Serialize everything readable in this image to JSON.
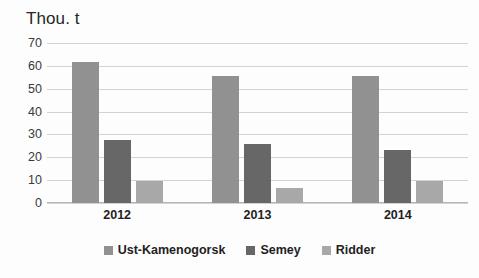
{
  "chart_data": {
    "type": "bar",
    "title": "Thou. t",
    "xlabel": "",
    "ylabel": "",
    "ylim": [
      0,
      70
    ],
    "ytick_step": 10,
    "yticks": [
      70,
      60,
      50,
      40,
      30,
      20,
      10,
      0
    ],
    "grid": true,
    "legend_position": "bottom",
    "categories": [
      "2012",
      "2013",
      "2014"
    ],
    "series": [
      {
        "name": "Ust-Kamenogorsk",
        "color": "#919191",
        "values": [
          61.7,
          55.5,
          55.5
        ]
      },
      {
        "name": "Semey",
        "color": "#676767",
        "values": [
          27.5,
          25.8,
          23.0
        ]
      },
      {
        "name": "Ridder",
        "color": "#a8a8a8",
        "values": [
          9.6,
          6.5,
          9.5
        ]
      }
    ]
  }
}
